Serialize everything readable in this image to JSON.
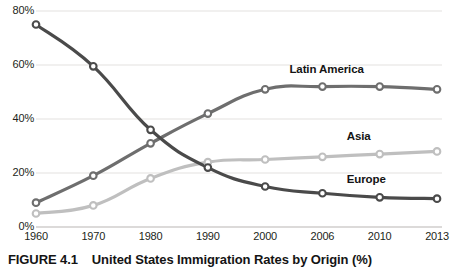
{
  "caption": {
    "figure_id": "FIGURE 4.1",
    "title": "United States Immigration Rates by Origin (%)"
  },
  "axes": {
    "y_ticks": [
      "0%",
      "20%",
      "40%",
      "60%",
      "80%"
    ],
    "x_ticks": [
      "1960",
      "1970",
      "1980",
      "1990",
      "2000",
      "2006",
      "2010",
      "2013"
    ]
  },
  "series_labels": {
    "latin_america": "Latin America",
    "asia": "Asia",
    "europe": "Europe"
  },
  "colors": {
    "europe": "#4a4a4a",
    "latin_america": "#6e6e6e",
    "asia": "#bfbfbf",
    "gridline": "#e3e1df",
    "axis_text": "#231f20"
  },
  "chart_data": {
    "type": "line",
    "title": "United States Immigration Rates by Origin (%)",
    "xlabel": "",
    "ylabel": "",
    "ylim": [
      0,
      80
    ],
    "grid": true,
    "legend_position": "inline-labels",
    "categories": [
      "1960",
      "1970",
      "1980",
      "1990",
      "2000",
      "2006",
      "2010",
      "2013"
    ],
    "series": [
      {
        "name": "Europe",
        "color": "#4a4a4a",
        "values": [
          75,
          59.5,
          36,
          22,
          15,
          12.5,
          11,
          10.5
        ]
      },
      {
        "name": "Latin America",
        "color": "#6e6e6e",
        "values": [
          9,
          19,
          31,
          42,
          51,
          52,
          52,
          51
        ]
      },
      {
        "name": "Asia",
        "color": "#bfbfbf",
        "values": [
          5,
          8,
          18,
          24,
          25,
          26,
          27,
          28
        ]
      }
    ]
  }
}
